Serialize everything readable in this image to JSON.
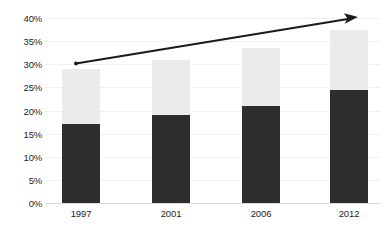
{
  "chart_data": {
    "type": "bar",
    "title": "",
    "subtitle": "",
    "xlabel": "",
    "ylabel": "",
    "categories": [
      "1997",
      "2001",
      "2006",
      "2012"
    ],
    "series": [
      {
        "name": "lower-segment",
        "color": "#2e2e2e",
        "values": [
          17,
          19,
          21,
          24.5
        ]
      },
      {
        "name": "upper-segment",
        "color": "#e9ebec",
        "values": [
          12,
          12,
          12.5,
          13
        ]
      }
    ],
    "totals": [
      29,
      31,
      33.5,
      37.5
    ],
    "stacked": true,
    "ylim": [
      0,
      40
    ],
    "ytick_labels": [
      "40%",
      "35%",
      "30%",
      "25%",
      "20%",
      "15%",
      "10%",
      "5%",
      "0%"
    ],
    "ytick_values": [
      40,
      35,
      30,
      25,
      20,
      15,
      10,
      5,
      0
    ],
    "grid": true,
    "legend": "none",
    "annotations": [
      {
        "name": "upward-trend-arrow",
        "type": "arrow",
        "from_value": 30,
        "to_value": 40,
        "color": "#1a1a1a"
      }
    ]
  },
  "edge_text": {
    "top_clipped": "",
    "bottom_clipped": ""
  }
}
